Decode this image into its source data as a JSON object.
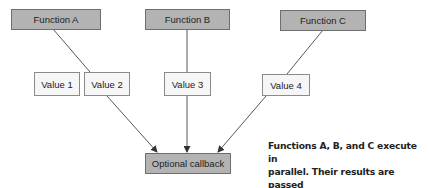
{
  "diagram": {
    "functions": [
      {
        "id": "A",
        "label": "Function A"
      },
      {
        "id": "B",
        "label": "Function B"
      },
      {
        "id": "C",
        "label": "Function C"
      }
    ],
    "values": [
      {
        "label": "Value 1"
      },
      {
        "label": "Value 2"
      },
      {
        "label": "Value 3"
      },
      {
        "label": "Value 4"
      }
    ],
    "callback": {
      "label": "Optional callback"
    },
    "edges": [
      {
        "from": "Function A",
        "to": "Value 2"
      },
      {
        "from": "Function B",
        "to": "Value 3"
      },
      {
        "from": "Function C",
        "to": "Value 4"
      },
      {
        "from": "Value 2",
        "to": "Optional callback",
        "arrow": true
      },
      {
        "from": "Value 3",
        "to": "Optional callback",
        "arrow": true
      },
      {
        "from": "Value 4",
        "to": "Optional callback",
        "arrow": true
      }
    ],
    "annotation": {
      "line1": "Functions A, B, and C execute in",
      "line2": "parallel. Their results are passed",
      "line3": "in to the optional callback."
    },
    "colors": {
      "function_fill": "#b3b3b3",
      "value_fill": "#f6f6f6",
      "line": "#444444"
    }
  }
}
